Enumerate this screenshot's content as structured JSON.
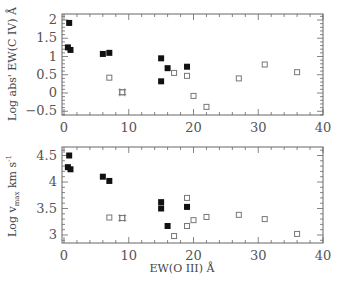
{
  "chart_data": [
    {
      "type": "scatter",
      "panel": "top",
      "title": "",
      "xlabel": "",
      "ylabel": "Log abs' EW(C IV) Å",
      "xlim": [
        -1,
        40
      ],
      "ylim": [
        -0.6,
        2.13
      ],
      "xticks": [
        "0",
        "10",
        "20",
        "30",
        "40"
      ],
      "yticks": [
        "-0.5",
        "0",
        "0.5",
        "1",
        "1.5",
        "2"
      ],
      "ytick_values": [
        -0.5,
        0,
        0.5,
        1,
        1.5,
        2
      ],
      "xtick_values": [
        0,
        10,
        20,
        30,
        40
      ],
      "grid": false,
      "series": [
        {
          "name": "filled",
          "marker": "filled-square",
          "points": [
            [
              0.8,
              1.92
            ],
            [
              0.6,
              1.25
            ],
            [
              1.0,
              1.18
            ],
            [
              6,
              1.07
            ],
            [
              7,
              1.1
            ],
            [
              15,
              0.95
            ],
            [
              16,
              0.68
            ],
            [
              19,
              0.72
            ],
            [
              15,
              0.32
            ]
          ]
        },
        {
          "name": "open",
          "marker": "open-square",
          "points": [
            [
              7,
              0.42
            ],
            [
              17,
              0.55
            ],
            [
              19,
              0.47
            ],
            [
              20,
              -0.08
            ],
            [
              22,
              -0.38
            ],
            [
              27,
              0.4
            ],
            [
              31,
              0.78
            ],
            [
              36,
              0.57
            ]
          ]
        },
        {
          "name": "hatched",
          "marker": "crossed-square",
          "points": [
            [
              9,
              0.02
            ]
          ]
        }
      ]
    },
    {
      "type": "scatter",
      "panel": "bottom",
      "title": "",
      "xlabel": "EW(O III) Å",
      "ylabel": "Log v_max km s^-1",
      "xlim": [
        -1,
        40
      ],
      "ylim": [
        2.85,
        4.65
      ],
      "xticks": [
        "0",
        "10",
        "20",
        "30",
        "40"
      ],
      "yticks": [
        "3",
        "3.5",
        "4",
        "4.5"
      ],
      "ytick_values": [
        3,
        3.5,
        4,
        4.5
      ],
      "xtick_values": [
        0,
        10,
        20,
        30,
        40
      ],
      "grid": false,
      "series": [
        {
          "name": "filled",
          "marker": "filled-square",
          "points": [
            [
              0.8,
              4.5
            ],
            [
              0.6,
              4.28
            ],
            [
              1.0,
              4.24
            ],
            [
              6,
              4.1
            ],
            [
              7,
              4.02
            ],
            [
              15,
              3.62
            ],
            [
              15,
              3.5
            ],
            [
              19,
              3.53
            ],
            [
              16,
              3.17
            ]
          ]
        },
        {
          "name": "open",
          "marker": "open-square",
          "points": [
            [
              7,
              3.33
            ],
            [
              17,
              2.98
            ],
            [
              19,
              3.17
            ],
            [
              19,
              3.7
            ],
            [
              20,
              3.28
            ],
            [
              22,
              3.34
            ],
            [
              27,
              3.38
            ],
            [
              31,
              3.3
            ],
            [
              36,
              3.02
            ]
          ]
        },
        {
          "name": "hatched",
          "marker": "crossed-square",
          "points": [
            [
              9,
              3.32
            ]
          ]
        }
      ]
    }
  ],
  "labels": {
    "top_ylabel": "Log abs' EW(C IV) Å",
    "bottom_ylabel_main": "Log v",
    "bottom_ylabel_sub": "max",
    "bottom_ylabel_unit": " km s",
    "bottom_ylabel_sup": "-1",
    "xlabel": "EW(O III) Å"
  },
  "colors": {
    "frame": "#666666",
    "marker_filled": "#111111",
    "marker_open": "#777777",
    "text": "#555555"
  }
}
